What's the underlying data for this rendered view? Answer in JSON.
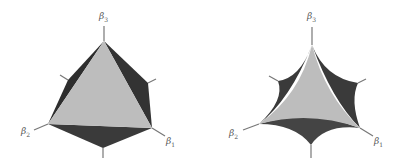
{
  "figures": [
    {
      "name": "polytope-tetrahedron",
      "labels": {
        "b3": "β",
        "b3_sub": "3",
        "b2": "β",
        "b2_sub": "2",
        "b1": "β",
        "b1_sub": "1"
      }
    },
    {
      "name": "curved-tetrahedron",
      "labels": {
        "b3": "β",
        "b3_sub": "3",
        "b2": "β",
        "b2_sub": "2",
        "b1": "β",
        "b1_sub": "1"
      }
    }
  ],
  "colors": {
    "face_light": "#bdbdbd",
    "face_dark": "#3a3a3a",
    "axis": "#777777"
  }
}
